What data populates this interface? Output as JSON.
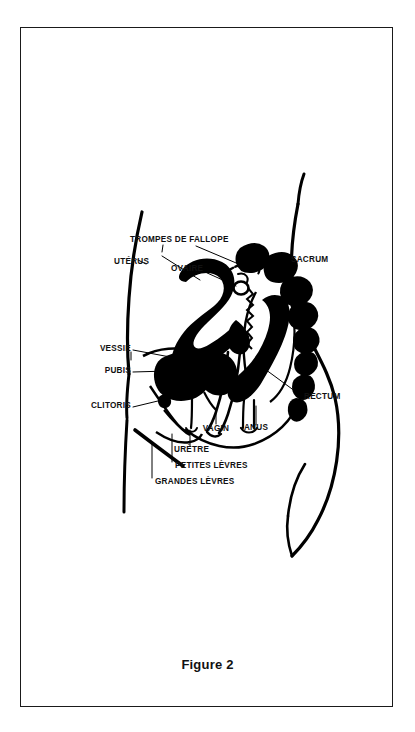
{
  "figure": {
    "caption": "Figure 2",
    "border_color": "#1a1a1a",
    "ink_color": "#000000",
    "background_color": "#ffffff"
  },
  "diagram": {
    "kind": "anatomical-cross-section",
    "language": "fr"
  },
  "labels": {
    "trompes_de_fallope": "TROMPES DE FALLOPE",
    "uterus": "UTÉRUS",
    "ovaire": "OVAIRE",
    "sacrum": "SACRUM",
    "vessie": "VESSIE",
    "pubis": "PUBIS",
    "clitoris": "CLITORIS",
    "rectum": "RECTUM",
    "anus": "ANUS",
    "vagin": "VAGIN",
    "uretre": "URÈTRE",
    "petites_levres": "PETITES LÈVRES",
    "grandes_levres": "GRANDES LÈVRES"
  }
}
